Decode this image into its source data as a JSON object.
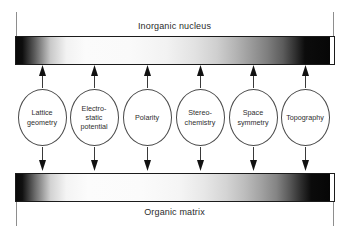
{
  "figure": {
    "title_top": "Inorganic nucleus",
    "title_bottom": "Organic matrix",
    "bars": [
      {
        "name": "inorganic-nucleus-bar",
        "caption": "Inorganic nucleus",
        "position": "top"
      },
      {
        "name": "organic-matrix-bar",
        "caption": "Organic matrix",
        "position": "bottom"
      }
    ],
    "nodes": [
      {
        "label": "Lattice\ngeometry",
        "cx": 42
      },
      {
        "label": "Electro-\nstatic\npotential",
        "cx": 94
      },
      {
        "label": "Polarity",
        "cx": 147
      },
      {
        "label": "Stereo-\nchemistry",
        "cx": 200
      },
      {
        "label": "Space\nsymmetry",
        "cx": 253
      },
      {
        "label": "Topography",
        "cx": 305
      }
    ],
    "arrow_x": [
      42,
      94,
      147,
      200,
      253,
      305
    ],
    "colors": {
      "bar_border": "#1b1b1b",
      "circle_stroke": "#4a4a4a",
      "text": "#2e2e2e",
      "tick": "#8e8e8e",
      "background": "#ffffff"
    }
  }
}
